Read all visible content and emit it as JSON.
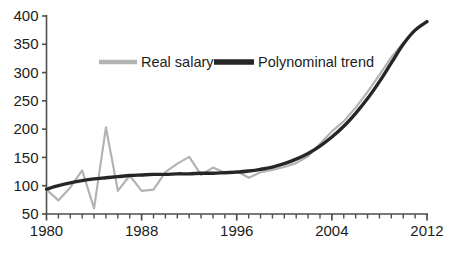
{
  "chart_data": {
    "type": "line",
    "title": "",
    "subtitle": "",
    "xlabel": "",
    "ylabel": "",
    "xlim": [
      1980,
      2012
    ],
    "ylim": [
      50,
      400
    ],
    "yticks": [
      50,
      100,
      150,
      200,
      250,
      300,
      350,
      400
    ],
    "xticks": [
      1980,
      1988,
      1996,
      2004,
      2012
    ],
    "x_minor_tick_step": 1,
    "grid": false,
    "legend_position": "upper-center",
    "x": [
      1980,
      1981,
      1982,
      1983,
      1984,
      1985,
      1986,
      1987,
      1988,
      1989,
      1990,
      1991,
      1992,
      1993,
      1994,
      1995,
      1996,
      1997,
      1998,
      1999,
      2000,
      2001,
      2002,
      2003,
      2004,
      2005,
      2006,
      2007,
      2008,
      2009,
      2010,
      2011,
      2012
    ],
    "series": [
      {
        "name": "Real salary",
        "color": "#b3b3b3",
        "line_width": 2.2,
        "values": [
          93,
          74,
          97,
          127,
          60,
          203,
          91,
          118,
          91,
          93,
          124,
          139,
          151,
          119,
          132,
          123,
          126,
          114,
          124,
          128,
          133,
          140,
          152,
          174,
          196,
          214,
          238,
          266,
          296,
          327,
          352,
          374,
          390
        ]
      },
      {
        "name": "Polynominal trend",
        "color": "#262626",
        "line_width": 3.4,
        "values": [
          94,
          100,
          105,
          109,
          112,
          114,
          116,
          118,
          119,
          120,
          120,
          121,
          121,
          122,
          122,
          123,
          124,
          126,
          129,
          133,
          139,
          147,
          157,
          170,
          186,
          205,
          228,
          254,
          284,
          317,
          350,
          375,
          390
        ]
      }
    ],
    "legend": [
      {
        "label": "Real salary",
        "color": "#b3b3b3",
        "line_width": 4.5
      },
      {
        "label": "Polynominal trend",
        "color": "#262626",
        "line_width": 5.5
      }
    ],
    "axis_color": "#4d4d4d"
  },
  "axis": {
    "y_tick_labels": [
      "400",
      "350",
      "300",
      "250",
      "200",
      "150",
      "100",
      "50"
    ],
    "x_tick_labels": [
      "1980",
      "1988",
      "1996",
      "2004",
      "2012"
    ]
  },
  "legend": {
    "real_salary_label": "Real salary",
    "trend_label": "Polynominal trend"
  }
}
